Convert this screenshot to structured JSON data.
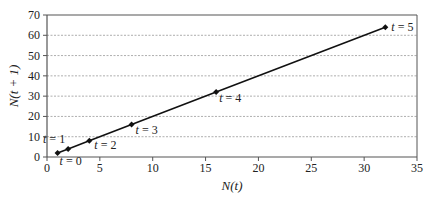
{
  "chart_data": {
    "type": "line",
    "title": "",
    "xlabel": "N(t)",
    "ylabel": "N(t + 1)",
    "xlim": [
      0,
      35
    ],
    "ylim": [
      0,
      70
    ],
    "xticks": [
      0,
      5,
      10,
      15,
      20,
      25,
      30,
      35
    ],
    "yticks": [
      0,
      10,
      20,
      30,
      40,
      50,
      60,
      70
    ],
    "grid": "horizontal dotted",
    "legend": "none",
    "series": [
      {
        "name": "N(t+1) vs N(t)",
        "x": [
          1,
          2,
          4,
          8,
          16,
          32
        ],
        "y": [
          2,
          4,
          8,
          16,
          32,
          64
        ],
        "labels": [
          "t = 0",
          "t = 1",
          "t = 2",
          "t = 3",
          "t = 4",
          "t = 5"
        ]
      }
    ]
  },
  "colors": {
    "line": "#111111",
    "grid": "#999999",
    "axis": "#555555"
  }
}
